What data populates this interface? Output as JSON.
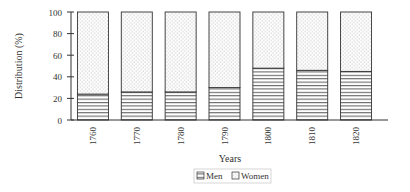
{
  "chart_data": {
    "type": "bar",
    "stacked": true,
    "title": "",
    "xlabel": "Years",
    "ylabel": "Distribution (%)",
    "ylim": [
      0,
      100
    ],
    "yticks": [
      0,
      20,
      40,
      60,
      80,
      100
    ],
    "categories": [
      "1760",
      "1770",
      "1780",
      "1790",
      "1800",
      "1810",
      "1820"
    ],
    "series": [
      {
        "name": "Men",
        "pattern": "horizontal-lines",
        "values": [
          24,
          26,
          26,
          30,
          48,
          46,
          45
        ]
      },
      {
        "name": "Women",
        "pattern": "dots",
        "values": [
          76,
          74,
          74,
          70,
          52,
          54,
          55
        ]
      }
    ],
    "legend": {
      "position": "bottom-center",
      "entries": [
        "Men",
        "Women"
      ]
    },
    "grid": false
  }
}
